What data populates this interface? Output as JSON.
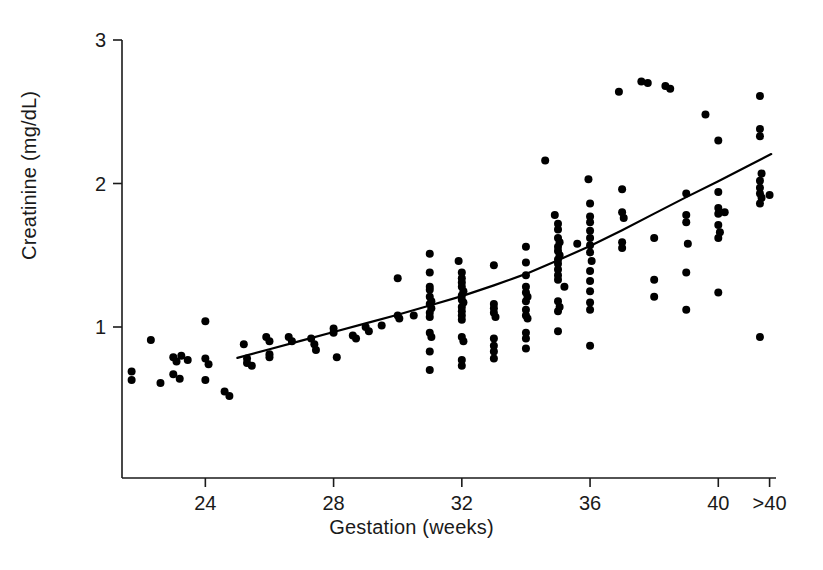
{
  "chart_data": {
    "type": "scatter",
    "title": "",
    "xlabel": "Gestation (weeks)",
    "ylabel": "Creatinine (mg/dL)",
    "xlim": [
      21.4,
      41.8
    ],
    "ylim": [
      0.0,
      3.0
    ],
    "grid": false,
    "legend": null,
    "x_tick_labels": [
      "24",
      "28",
      "32",
      "36",
      "40",
      ">40"
    ],
    "x_tick_values": [
      24,
      28,
      32,
      36,
      40,
      41.6
    ],
    "y_tick_labels": [
      "1",
      "2",
      "3"
    ],
    "y_tick_values": [
      1,
      2,
      3
    ],
    "marker": {
      "shape": "circle",
      "color": "#000000",
      "size_px": 8
    },
    "fit_curve": {
      "name": "smoothed fit",
      "color": "#000000",
      "width_px": 2.2,
      "points": [
        [
          25.0,
          0.785
        ],
        [
          26.0,
          0.845
        ],
        [
          27.0,
          0.905
        ],
        [
          28.0,
          0.965
        ],
        [
          29.0,
          1.025
        ],
        [
          30.0,
          1.085
        ],
        [
          31.0,
          1.15
        ],
        [
          32.0,
          1.215
        ],
        [
          33.0,
          1.29
        ],
        [
          34.0,
          1.37
        ],
        [
          35.0,
          1.465
        ],
        [
          36.0,
          1.565
        ],
        [
          37.0,
          1.675
        ],
        [
          38.0,
          1.79
        ],
        [
          39.0,
          1.905
        ],
        [
          40.0,
          2.015
        ],
        [
          41.0,
          2.13
        ],
        [
          41.65,
          2.205
        ]
      ]
    },
    "points": [
      [
        21.7,
        0.69
      ],
      [
        21.7,
        0.63
      ],
      [
        22.3,
        0.91
      ],
      [
        22.6,
        0.61
      ],
      [
        23.0,
        0.79
      ],
      [
        23.1,
        0.76
      ],
      [
        23.25,
        0.8
      ],
      [
        23.45,
        0.77
      ],
      [
        23.0,
        0.67
      ],
      [
        23.2,
        0.64
      ],
      [
        24.0,
        1.04
      ],
      [
        24.0,
        0.78
      ],
      [
        24.1,
        0.74
      ],
      [
        24.0,
        0.63
      ],
      [
        24.6,
        0.55
      ],
      [
        24.75,
        0.52
      ],
      [
        25.2,
        0.88
      ],
      [
        25.3,
        0.78
      ],
      [
        25.3,
        0.75
      ],
      [
        25.45,
        0.73
      ],
      [
        25.9,
        0.93
      ],
      [
        26.0,
        0.9
      ],
      [
        26.0,
        0.81
      ],
      [
        26.0,
        0.79
      ],
      [
        26.6,
        0.93
      ],
      [
        26.7,
        0.9
      ],
      [
        27.3,
        0.92
      ],
      [
        27.4,
        0.88
      ],
      [
        27.45,
        0.84
      ],
      [
        28.0,
        0.99
      ],
      [
        28.0,
        0.96
      ],
      [
        28.1,
        0.79
      ],
      [
        28.6,
        0.94
      ],
      [
        28.7,
        0.92
      ],
      [
        29.0,
        1.0
      ],
      [
        29.1,
        0.97
      ],
      [
        29.5,
        1.01
      ],
      [
        30.0,
        1.34
      ],
      [
        30.0,
        1.08
      ],
      [
        30.05,
        1.06
      ],
      [
        30.5,
        1.08
      ],
      [
        31.0,
        1.51
      ],
      [
        31.0,
        1.38
      ],
      [
        31.0,
        1.28
      ],
      [
        31.0,
        1.26
      ],
      [
        31.0,
        1.21
      ],
      [
        31.05,
        1.18
      ],
      [
        31.0,
        1.16
      ],
      [
        31.05,
        1.13
      ],
      [
        31.0,
        1.1
      ],
      [
        31.0,
        1.07
      ],
      [
        31.0,
        0.96
      ],
      [
        31.05,
        0.93
      ],
      [
        31.0,
        0.83
      ],
      [
        31.0,
        0.7
      ],
      [
        31.9,
        1.46
      ],
      [
        32.0,
        1.38
      ],
      [
        32.0,
        1.34
      ],
      [
        32.0,
        1.31
      ],
      [
        32.0,
        1.28
      ],
      [
        32.05,
        1.25
      ],
      [
        32.0,
        1.22
      ],
      [
        32.0,
        1.19
      ],
      [
        32.05,
        1.17
      ],
      [
        32.0,
        1.14
      ],
      [
        32.0,
        1.11
      ],
      [
        32.0,
        1.08
      ],
      [
        32.0,
        1.05
      ],
      [
        32.0,
        0.93
      ],
      [
        32.05,
        0.9
      ],
      [
        32.0,
        0.77
      ],
      [
        32.0,
        0.73
      ],
      [
        33.0,
        1.43
      ],
      [
        33.0,
        1.16
      ],
      [
        33.0,
        1.13
      ],
      [
        33.0,
        1.1
      ],
      [
        33.05,
        1.07
      ],
      [
        33.0,
        0.92
      ],
      [
        33.0,
        0.87
      ],
      [
        33.0,
        0.83
      ],
      [
        33.0,
        0.78
      ],
      [
        34.0,
        1.56
      ],
      [
        34.0,
        1.45
      ],
      [
        34.0,
        1.36
      ],
      [
        34.0,
        1.28
      ],
      [
        34.0,
        1.24
      ],
      [
        34.05,
        1.21
      ],
      [
        34.0,
        1.18
      ],
      [
        34.0,
        1.12
      ],
      [
        34.0,
        1.08
      ],
      [
        34.05,
        1.06
      ],
      [
        34.0,
        0.96
      ],
      [
        34.0,
        0.92
      ],
      [
        34.0,
        0.85
      ],
      [
        34.6,
        2.16
      ],
      [
        34.9,
        1.78
      ],
      [
        35.0,
        1.72
      ],
      [
        35.0,
        1.68
      ],
      [
        35.0,
        1.62
      ],
      [
        35.05,
        1.59
      ],
      [
        35.0,
        1.56
      ],
      [
        35.0,
        1.53
      ],
      [
        35.05,
        1.5
      ],
      [
        35.0,
        1.47
      ],
      [
        35.0,
        1.44
      ],
      [
        35.0,
        1.4
      ],
      [
        35.0,
        1.36
      ],
      [
        35.0,
        1.33
      ],
      [
        35.2,
        1.28
      ],
      [
        35.0,
        1.18
      ],
      [
        35.05,
        1.14
      ],
      [
        35.0,
        1.11
      ],
      [
        35.0,
        0.97
      ],
      [
        35.6,
        1.58
      ],
      [
        35.95,
        2.03
      ],
      [
        36.0,
        1.86
      ],
      [
        36.0,
        1.77
      ],
      [
        36.0,
        1.73
      ],
      [
        36.0,
        1.67
      ],
      [
        36.0,
        1.62
      ],
      [
        36.0,
        1.57
      ],
      [
        36.0,
        1.52
      ],
      [
        36.05,
        1.46
      ],
      [
        36.0,
        1.39
      ],
      [
        36.0,
        1.32
      ],
      [
        36.0,
        1.25
      ],
      [
        36.0,
        1.17
      ],
      [
        36.0,
        1.12
      ],
      [
        36.0,
        0.87
      ],
      [
        36.9,
        2.64
      ],
      [
        37.0,
        1.96
      ],
      [
        37.0,
        1.8
      ],
      [
        37.05,
        1.76
      ],
      [
        37.0,
        1.59
      ],
      [
        37.0,
        1.55
      ],
      [
        37.6,
        2.71
      ],
      [
        37.8,
        2.7
      ],
      [
        38.0,
        1.62
      ],
      [
        38.0,
        1.33
      ],
      [
        38.0,
        1.21
      ],
      [
        38.35,
        2.68
      ],
      [
        38.5,
        2.66
      ],
      [
        39.0,
        1.93
      ],
      [
        39.0,
        1.78
      ],
      [
        39.0,
        1.73
      ],
      [
        39.05,
        1.58
      ],
      [
        39.0,
        1.38
      ],
      [
        39.0,
        1.12
      ],
      [
        39.6,
        2.48
      ],
      [
        40.0,
        2.3
      ],
      [
        40.0,
        1.94
      ],
      [
        40.0,
        1.83
      ],
      [
        40.0,
        1.79
      ],
      [
        40.0,
        1.71
      ],
      [
        40.05,
        1.66
      ],
      [
        40.0,
        1.62
      ],
      [
        40.2,
        1.8
      ],
      [
        40.0,
        1.24
      ],
      [
        41.3,
        2.61
      ],
      [
        41.3,
        2.38
      ],
      [
        41.3,
        2.33
      ],
      [
        41.35,
        2.07
      ],
      [
        41.3,
        2.02
      ],
      [
        41.3,
        1.97
      ],
      [
        41.3,
        1.93
      ],
      [
        41.35,
        1.9
      ],
      [
        41.3,
        1.86
      ],
      [
        41.6,
        1.92
      ],
      [
        41.3,
        0.93
      ]
    ]
  },
  "axes": {
    "x_label": "Gestation (weeks)",
    "y_label": "Creatinine (mg/dL)"
  }
}
